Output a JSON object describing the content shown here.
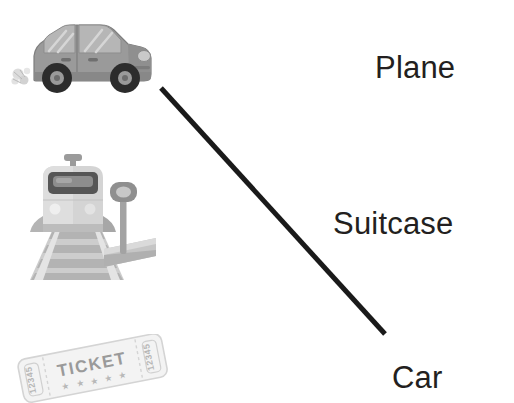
{
  "exercise": {
    "type": "matching",
    "background_color": "#ffffff",
    "instructions_visible": false
  },
  "left_column": {
    "items": [
      {
        "id": "car-illustration",
        "kind": "image",
        "subject": "car",
        "description": "grayscale side view of a small rounded car with exhaust puffs",
        "colors": {
          "body": "#9a9a9a",
          "body_shade": "#8a8a8a",
          "window": "#b4b4b4",
          "window_stripe": "#cfcfcf",
          "tire": "#2e2e2e",
          "hub": "#9a9a9a",
          "smoke": "#d8d8d8",
          "outline": "#7c7c7c"
        }
      },
      {
        "id": "train-illustration",
        "kind": "image",
        "subject": "train",
        "description": "grayscale front view of a commuter train on tracks next to a platform sign",
        "colors": {
          "body": "#b0b0b0",
          "body_light": "#d2d2d2",
          "window_band": "#5a5a5a",
          "window_glass": "#8e8e8e",
          "headlight": "#e8e8e8",
          "rail": "#d6d6d6",
          "sleeper": "#b9b9b9",
          "ballast": "#c8c8c8",
          "platform": "#c3c3c3",
          "sign_post": "#a8a8a8",
          "sign_head": "#8f8f8f"
        }
      },
      {
        "id": "ticket-illustration",
        "kind": "image",
        "subject": "ticket",
        "description": "pale grey admission ticket tilted on its side",
        "text": {
          "main": "TICKET",
          "stub_left": "12345",
          "stub_right": "12345",
          "stars": "★ ★ ★ ★ ★"
        },
        "colors": {
          "paper": "#f2f2f2",
          "paper_edge": "#d9d9d9",
          "ink": "#9f9f9f",
          "ink_light": "#c2c2c2"
        }
      }
    ]
  },
  "right_column": {
    "labels": [
      {
        "id": "plane",
        "text": "Plane"
      },
      {
        "id": "suitcase",
        "text": "Suitcase"
      },
      {
        "id": "car",
        "text": "Car"
      }
    ]
  },
  "connections": [
    {
      "id": "car-to-car",
      "from": "car-illustration",
      "to": "car",
      "x1": 161,
      "y1": 88,
      "x2": 385,
      "y2": 334,
      "color": "#1a1a1a",
      "stroke_width": 5
    }
  ]
}
